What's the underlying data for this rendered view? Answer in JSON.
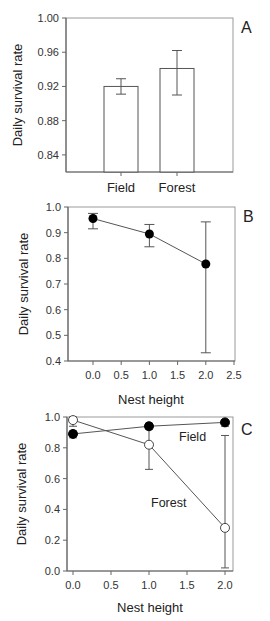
{
  "chart_data": [
    {
      "panel": "A",
      "type": "bar",
      "title": "",
      "xlabel": "",
      "ylabel": "Daily survival rate",
      "categories": [
        "Field",
        "Forest"
      ],
      "values": [
        0.92,
        0.941
      ],
      "error_low": [
        0.911,
        0.91
      ],
      "error_high": [
        0.929,
        0.962
      ],
      "ylim": [
        0.82,
        1.0
      ],
      "yticks": [
        0.84,
        0.88,
        0.92,
        0.96,
        1.0
      ],
      "ytick_labels": [
        "0.84",
        "0.88",
        "0.92",
        "0.96",
        "1.00"
      ],
      "grid": false,
      "bar_fill": "#ffffff",
      "bar_stroke": "#555555"
    },
    {
      "panel": "B",
      "type": "line",
      "title": "",
      "xlabel": "Nest height",
      "ylabel": "Daily survival rate",
      "x": [
        0.0,
        1.0,
        2.0
      ],
      "values": [
        0.955,
        0.895,
        0.778
      ],
      "error_low": [
        0.915,
        0.845,
        0.432
      ],
      "error_high": [
        0.975,
        0.932,
        0.942
      ],
      "xlim": [
        -0.45,
        2.5
      ],
      "ylim": [
        0.4,
        1.0
      ],
      "xticks": [
        0.0,
        0.5,
        1.0,
        1.5,
        2.0,
        2.5
      ],
      "xtick_labels": [
        "0.0",
        "0.5",
        "1.0",
        "1.5",
        "2.0",
        "2.5"
      ],
      "yticks": [
        0.4,
        0.5,
        0.6,
        0.7,
        0.8,
        0.9,
        1.0
      ],
      "ytick_labels": [
        "0.4",
        "0.5",
        "0.6",
        "0.7",
        "0.8",
        "0.9",
        "1.0"
      ],
      "marker": "filled-circle",
      "grid": false
    },
    {
      "panel": "C",
      "type": "line",
      "title": "",
      "xlabel": "Nest height",
      "ylabel": "Daily survival rate",
      "x": [
        0.0,
        1.0,
        2.0
      ],
      "series": [
        {
          "name": "Field",
          "marker": "filled-circle",
          "values": [
            0.89,
            0.94,
            0.965
          ],
          "error_low": [
            0.865,
            0.92,
            0.94
          ],
          "error_high": [
            0.91,
            0.955,
            0.98
          ]
        },
        {
          "name": "Forest",
          "marker": "open-circle",
          "values": [
            0.98,
            0.82,
            0.28
          ],
          "error_low": [
            0.94,
            0.66,
            0.02
          ],
          "error_high": [
            1.0,
            0.96,
            0.88
          ]
        }
      ],
      "xlim": [
        -0.08,
        2.1
      ],
      "ylim": [
        0.0,
        1.0
      ],
      "xticks": [
        0.0,
        0.5,
        1.0,
        1.5,
        2.0
      ],
      "xtick_labels": [
        "0.0",
        "0.5",
        "1.0",
        "1.5",
        "2.0"
      ],
      "yticks": [
        0.0,
        0.2,
        0.4,
        0.6,
        0.8,
        1.0
      ],
      "ytick_labels": [
        "0.0",
        "0.2",
        "0.4",
        "0.6",
        "0.8",
        "1.0"
      ],
      "annotations": [
        "Field",
        "Forest"
      ],
      "grid": false
    }
  ],
  "panels": {
    "a": {
      "letter": "A",
      "ylabel": "Daily survival rate",
      "cat0": "Field",
      "cat1": "Forest"
    },
    "b": {
      "letter": "B",
      "ylabel": "Daily survival rate",
      "xlabel": "Nest height"
    },
    "c": {
      "letter": "C",
      "ylabel": "Daily survival rate",
      "xlabel": "Nest height",
      "field_label": "Field",
      "forest_label": "Forest"
    }
  }
}
